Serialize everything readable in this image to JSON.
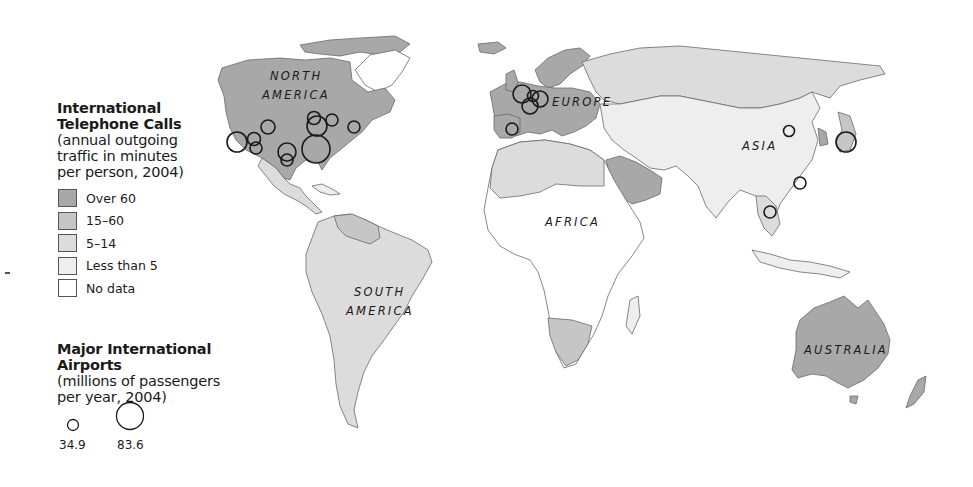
{
  "legend": {
    "phone_title": [
      "International",
      "Telephone Calls"
    ],
    "phone_subtitle": [
      "(annual outgoing",
      "traffic in minutes",
      "per person, 2004)"
    ],
    "categories": [
      {
        "label": "Over 60",
        "color": "#a8a8a8"
      },
      {
        "label": "15–60",
        "color": "#c6c6c6"
      },
      {
        "label": "5–14",
        "color": "#dcdcdc"
      },
      {
        "label": "Less than 5",
        "color": "#eeeeee"
      },
      {
        "label": "No data",
        "color": "#ffffff"
      }
    ],
    "airport_title": "Major International Airports",
    "airport_subtitle": [
      "(millions of passengers",
      "per year, 2004)"
    ],
    "bubble_sizes": [
      {
        "label": "34.9",
        "value": 34.9
      },
      {
        "label": "83.6",
        "value": 83.6
      }
    ]
  },
  "map": {
    "continent_labels": [
      {
        "name": "north-america",
        "lines": [
          "NORTH",
          "AMERICA"
        ]
      },
      {
        "name": "south-america",
        "lines": [
          "SOUTH",
          "AMERICA"
        ]
      },
      {
        "name": "europe",
        "lines": [
          "EUROPE"
        ]
      },
      {
        "name": "africa",
        "lines": [
          "AFRICA"
        ]
      },
      {
        "name": "asia",
        "lines": [
          "ASIA"
        ]
      },
      {
        "name": "australia",
        "lines": [
          "AUSTRALIA"
        ]
      }
    ]
  }
}
